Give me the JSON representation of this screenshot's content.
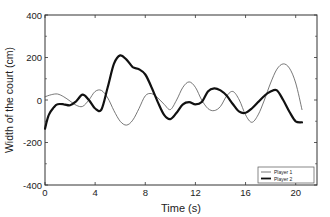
{
  "chart_data": {
    "type": "line",
    "title": "",
    "xlabel": "Time (s)",
    "ylabel": "Width of the court  (cm)",
    "xlim": [
      0,
      21.7
    ],
    "ylim": [
      -400,
      400
    ],
    "xticks": [
      0,
      4,
      8,
      12,
      16,
      20
    ],
    "yticks": [
      -400,
      -200,
      0,
      200,
      400
    ],
    "xtick_labels": [
      "0",
      "4",
      "8",
      "12",
      "16",
      "20"
    ],
    "ytick_labels": [
      "-400",
      "-200",
      "0",
      "200",
      "400"
    ],
    "grid": false,
    "legend_position": "lower right",
    "series": [
      {
        "name": "Player 1",
        "style": "thin",
        "color": "#555555",
        "x": [
          0,
          0.5,
          1.0,
          1.5,
          2.0,
          2.5,
          3.0,
          3.5,
          4.0,
          4.5,
          5.0,
          5.5,
          6.0,
          6.5,
          7.0,
          7.5,
          8.0,
          8.5,
          9.0,
          9.5,
          10.0,
          10.5,
          11.0,
          11.5,
          12.0,
          12.5,
          13.0,
          13.5,
          14.0,
          14.5,
          15.0,
          15.5,
          16.0,
          16.5,
          17.0,
          17.5,
          18.0,
          18.5,
          19.0,
          19.5,
          20.0,
          20.5
        ],
        "y": [
          15,
          25,
          28,
          15,
          -5,
          -25,
          -30,
          0,
          40,
          45,
          10,
          -50,
          -100,
          -118,
          -95,
          -40,
          20,
          30,
          10,
          -20,
          -45,
          0,
          60,
          85,
          60,
          0,
          -40,
          -50,
          -30,
          20,
          40,
          0,
          -70,
          -105,
          -70,
          0,
          80,
          145,
          170,
          150,
          80,
          -45
        ]
      },
      {
        "name": "Player 2",
        "style": "thick",
        "color": "#111111",
        "x": [
          0,
          0.3,
          0.7,
          1.0,
          1.5,
          2.0,
          2.5,
          3.0,
          3.5,
          4.0,
          4.5,
          5.0,
          5.5,
          6.0,
          6.5,
          7.0,
          7.5,
          8.0,
          8.5,
          9.0,
          9.5,
          10.0,
          10.5,
          11.0,
          11.5,
          12.0,
          12.5,
          13.0,
          13.5,
          14.0,
          14.5,
          15.0,
          15.5,
          16.0,
          16.5,
          17.0,
          17.5,
          18.0,
          18.5,
          19.0,
          19.5,
          20.0,
          20.5
        ],
        "y": [
          -135,
          -70,
          -35,
          -20,
          -20,
          -25,
          -5,
          25,
          0,
          -40,
          -45,
          60,
          170,
          210,
          190,
          155,
          145,
          120,
          60,
          -10,
          -70,
          -90,
          -60,
          -20,
          -10,
          -20,
          -10,
          40,
          55,
          45,
          20,
          -20,
          -55,
          -60,
          -40,
          -10,
          20,
          40,
          45,
          0,
          -55,
          -100,
          -105
        ]
      }
    ]
  },
  "legend": {
    "items": [
      {
        "label": "Player 1",
        "style": "thin"
      },
      {
        "label": "Player 2",
        "style": "thick"
      }
    ]
  }
}
